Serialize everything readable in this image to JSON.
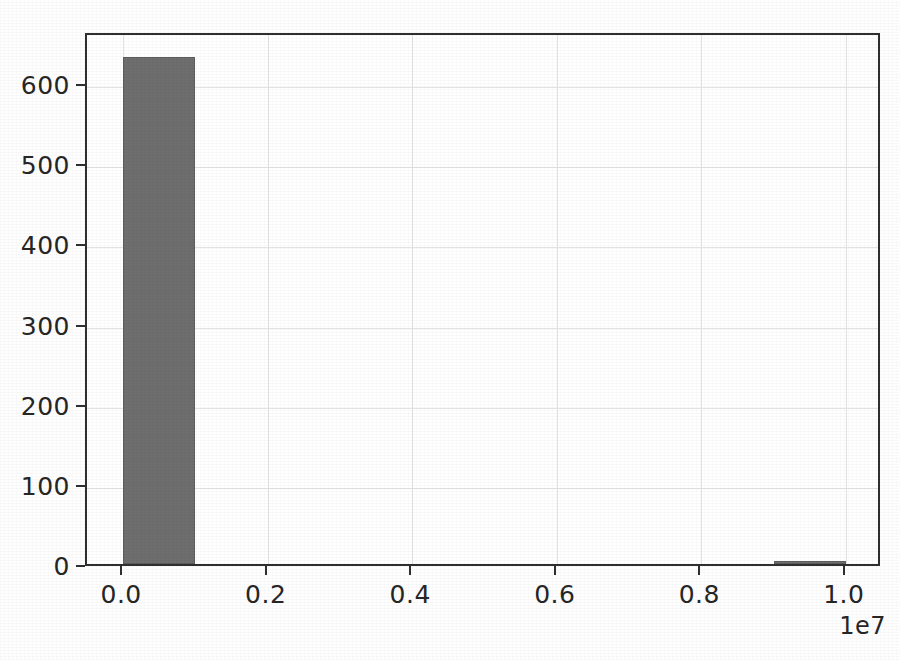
{
  "chart_data": {
    "type": "bar",
    "title": "",
    "subtitle": "",
    "xlabel": "",
    "ylabel": "",
    "x_offset_text": "1e7",
    "x_tick_labels": [
      "0.0",
      "0.2",
      "0.4",
      "0.6",
      "0.8",
      "1.0"
    ],
    "x_tick_values": [
      0,
      2000000,
      4000000,
      6000000,
      8000000,
      10000000
    ],
    "y_tick_labels": [
      "0",
      "100",
      "200",
      "300",
      "400",
      "500",
      "600"
    ],
    "y_tick_values": [
      0,
      100,
      200,
      300,
      400,
      500,
      600
    ],
    "xlim": [
      -500000,
      10500000
    ],
    "ylim": [
      0,
      665
    ],
    "grid": true,
    "legend": null,
    "bar_color": "#6e6e6e",
    "grid_color": "#e3e3e3",
    "axis_color": "#2f2f2f",
    "background_color": "#ffffff",
    "bins": [
      {
        "label": "0.0-0.1e7",
        "x_start": 0,
        "x_end": 1000000,
        "value": 632
      },
      {
        "label": "0.1-0.2e7",
        "x_start": 1000000,
        "x_end": 2000000,
        "value": 0
      },
      {
        "label": "0.2-0.3e7",
        "x_start": 2000000,
        "x_end": 3000000,
        "value": 0
      },
      {
        "label": "0.3-0.4e7",
        "x_start": 3000000,
        "x_end": 4000000,
        "value": 0
      },
      {
        "label": "0.4-0.5e7",
        "x_start": 4000000,
        "x_end": 5000000,
        "value": 0
      },
      {
        "label": "0.5-0.6e7",
        "x_start": 5000000,
        "x_end": 6000000,
        "value": 0
      },
      {
        "label": "0.6-0.7e7",
        "x_start": 6000000,
        "x_end": 7000000,
        "value": 0
      },
      {
        "label": "0.7-0.8e7",
        "x_start": 7000000,
        "x_end": 8000000,
        "value": 0
      },
      {
        "label": "0.8-0.9e7",
        "x_start": 8000000,
        "x_end": 9000000,
        "value": 0
      },
      {
        "label": "0.9-1.0e7",
        "x_start": 9000000,
        "x_end": 10000000,
        "value": 3
      }
    ],
    "categories": [
      "0.0-0.1e7",
      "0.1-0.2e7",
      "0.2-0.3e7",
      "0.3-0.4e7",
      "0.4-0.5e7",
      "0.5-0.6e7",
      "0.6-0.7e7",
      "0.7-0.8e7",
      "0.8-0.9e7",
      "0.9-1.0e7"
    ],
    "values": [
      632,
      0,
      0,
      0,
      0,
      0,
      0,
      0,
      0,
      3
    ]
  }
}
